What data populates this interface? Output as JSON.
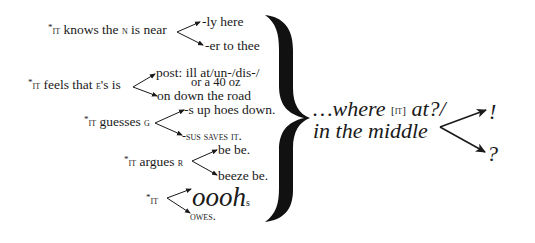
{
  "poem": {
    "branches": [
      {
        "stem_prefix": "*",
        "stem_it": "it",
        "stem_rest": " knows the ",
        "stem_letter": "n",
        "stem_tail": " is near",
        "upper": "-ly here",
        "lower": "-er to thee"
      },
      {
        "stem_prefix": "*",
        "stem_it": "it",
        "stem_rest": " feels that ",
        "stem_letter": "e",
        "stem_tail": "'s is",
        "upper": "post: ill at/un-/dis-/",
        "upper_line2": "or a 40 oz",
        "lower": "on down the road"
      },
      {
        "stem_prefix": "*",
        "stem_it": "it",
        "stem_rest": " guesses ",
        "stem_letter": "g",
        "stem_tail": "",
        "upper": "-s up hoes down.",
        "lower_pre": "-sus saves ",
        "lower_it": "it",
        "lower_post": "."
      },
      {
        "stem_prefix": "*",
        "stem_it": "it",
        "stem_rest": " argues ",
        "stem_letter": "r",
        "stem_tail": "",
        "upper": "be be.",
        "lower": "beeze be."
      },
      {
        "stem_prefix": "*",
        "stem_it": "it",
        "upper_main": "oooh",
        "upper_sub": "s",
        "lower": "owes."
      }
    ],
    "conclusion": {
      "line1_pre": "…where ",
      "line1_bracket": "[it]",
      "line1_post": " at?/",
      "line2": "in the middle",
      "upper_end": "!",
      "lower_end": "?"
    }
  }
}
